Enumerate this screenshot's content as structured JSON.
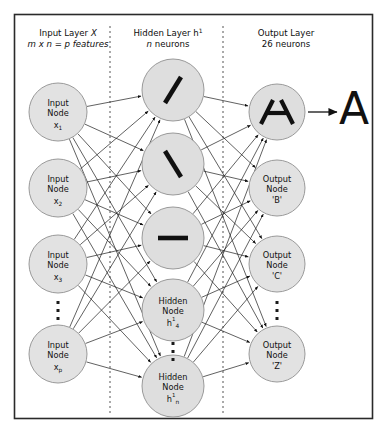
{
  "figure": {
    "border_color": "#2a2a2a",
    "background": "#ffffff",
    "node_fill": "#dedede",
    "node_stroke": "#9a9a9a",
    "edge_color": "#1d1d1d"
  },
  "headers": [
    {
      "id": "input-layer-header",
      "line1_pre": "Input Layer ",
      "line1_italic": "X",
      "line2": "m x n = p features",
      "x": 68,
      "y1": 36,
      "y2": 47
    },
    {
      "id": "hidden-layer-header",
      "line1_pre": "Hidden Layer h",
      "line1_sup": "1",
      "line2_italic": "n",
      "line2_post": " neurons",
      "x": 168,
      "y1": 36,
      "y2": 47
    },
    {
      "id": "output-layer-header",
      "line1": "Output Layer",
      "line2": "26 neurons",
      "x": 286,
      "y1": 36,
      "y2": 47
    }
  ],
  "dividers": [
    {
      "id": "divider-input-hidden",
      "x": 110,
      "y1": 26,
      "y2": 414
    },
    {
      "id": "divider-hidden-output",
      "x": 223,
      "y1": 26,
      "y2": 414
    }
  ],
  "input_nodes": [
    {
      "id": "input-node-x1",
      "line1": "Input",
      "line2": "Node",
      "base": "x",
      "sub": "1",
      "cx": 58,
      "cy": 112,
      "r": 29
    },
    {
      "id": "input-node-x2",
      "line1": "Input",
      "line2": "Node",
      "base": "x",
      "sub": "2",
      "cx": 58,
      "cy": 188,
      "r": 29
    },
    {
      "id": "input-node-x3",
      "line1": "Input",
      "line2": "Node",
      "base": "x",
      "sub": "3",
      "cx": 58,
      "cy": 264,
      "r": 29
    },
    {
      "id": "input-node-xp",
      "line1": "Input",
      "line2": "Node",
      "base": "x",
      "sub": "p",
      "cx": 58,
      "cy": 354,
      "r": 29
    }
  ],
  "input_ellipsis": {
    "id": "input-ellipsis",
    "cx": 58,
    "cy": 311
  },
  "hidden_nodes": [
    {
      "id": "hidden-node-1",
      "glyph": "forward-slash-stroke",
      "cx": 173,
      "cy": 90,
      "r": 31
    },
    {
      "id": "hidden-node-2",
      "glyph": "back-slash-stroke",
      "cx": 173,
      "cy": 164,
      "r": 31
    },
    {
      "id": "hidden-node-3",
      "glyph": "horizontal-bar-stroke",
      "cx": 173,
      "cy": 238,
      "r": 31
    },
    {
      "id": "hidden-node-4",
      "line1": "Hidden",
      "line2": "Node",
      "base": "h",
      "sup": "1",
      "sub": "4",
      "cx": 173,
      "cy": 310,
      "r": 31
    },
    {
      "id": "hidden-node-n",
      "line1": "Hidden",
      "line2": "Node",
      "base": "h",
      "sup": "1",
      "sub": "n",
      "cx": 173,
      "cy": 386,
      "r": 31
    }
  ],
  "hidden_ellipsis": {
    "id": "hidden-ellipsis",
    "cx": 173,
    "cy": 352
  },
  "output_nodes": [
    {
      "id": "output-node-a",
      "glyph": "letter-a-strokes",
      "cx": 277,
      "cy": 112,
      "r": 28
    },
    {
      "id": "output-node-b",
      "line1": "Output",
      "line2": "Node",
      "line3": "'B'",
      "cx": 277,
      "cy": 188,
      "r": 28
    },
    {
      "id": "output-node-c",
      "line1": "Output",
      "line2": "Node",
      "line3": "'C'",
      "cx": 277,
      "cy": 264,
      "r": 28
    },
    {
      "id": "output-node-z",
      "line1": "Output",
      "line2": "Node",
      "line3": "'Z'",
      "cx": 277,
      "cy": 354,
      "r": 28
    }
  ],
  "output_ellipsis": {
    "id": "output-ellipsis",
    "cx": 277,
    "cy": 311
  },
  "prediction": {
    "id": "prediction-letter",
    "letter": "A",
    "x": 354,
    "y": 112,
    "arrow_x1": 308,
    "arrow_x2": 337,
    "arrow_y": 112
  }
}
